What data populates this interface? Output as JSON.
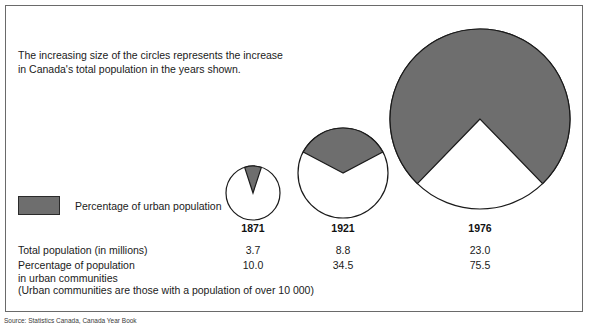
{
  "caption": {
    "line1": "The increasing size of the circles represents the increase",
    "line2": "in Canada's total population in the years shown."
  },
  "legend": {
    "label": "Percentage of urban population",
    "swatch_color": "#6e6e6e"
  },
  "table": {
    "row_labels": {
      "total_population": "Total population (in millions)",
      "percentage_urban_line1": "Percentage of population",
      "percentage_urban_line2": "in urban communities"
    },
    "footnote": "(Urban communities are those with a population of over 10 000)"
  },
  "source": "Source: Statistics Canada, Canada Year Book",
  "chart_data": {
    "type": "pie",
    "title": "The increasing size of the circles represents the increase in Canada's total population in the years shown.",
    "legend_entries": [
      "Percentage of urban population"
    ],
    "legend_position": "left",
    "radius_encodes": "total population (in millions)",
    "categories": [
      "1871",
      "1921",
      "1976"
    ],
    "series": [
      {
        "name": "Total population (in millions)",
        "values": [
          3.7,
          8.8,
          23.0
        ]
      },
      {
        "name": "Percentage of population in urban communities",
        "values": [
          10.0,
          34.5,
          75.5
        ]
      }
    ],
    "circles": [
      {
        "year": "1871",
        "total_population": 3.7,
        "urban_percent": 10.0,
        "cx": 253,
        "cy": 193,
        "r": 27,
        "label_y": 222
      },
      {
        "year": "1921",
        "total_population": 8.8,
        "urban_percent": 34.5,
        "cx": 343,
        "cy": 173,
        "r": 45,
        "label_y": 222
      },
      {
        "year": "1976",
        "total_population": 23.0,
        "urban_percent": 75.5,
        "cx": 480,
        "cy": 119,
        "r": 90,
        "label_y": 222
      }
    ],
    "colors": {
      "urban": "#6e6e6e",
      "rural": "#ffffff",
      "outline": "#1a1a1a"
    }
  }
}
